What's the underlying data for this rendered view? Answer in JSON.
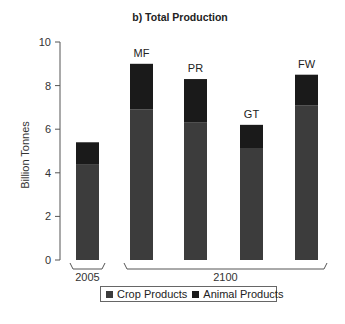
{
  "chart_data": {
    "type": "bar",
    "stacked": true,
    "title": "b) Total Production",
    "xlabel": "",
    "ylabel": "Billion Tonnes",
    "ylim": [
      0,
      10
    ],
    "yticks": [
      0,
      2,
      4,
      6,
      8,
      10
    ],
    "grid": false,
    "categories": [
      "2005",
      "MF",
      "PR",
      "GT",
      "FW"
    ],
    "bar_labels": [
      "",
      "MF",
      "PR",
      "GT",
      "FW"
    ],
    "groups": [
      {
        "label": "2005",
        "categories": [
          "2005"
        ]
      },
      {
        "label": "2100",
        "categories": [
          "MF",
          "PR",
          "GT",
          "FW"
        ]
      }
    ],
    "series": [
      {
        "name": "Crop Products",
        "color": "#3c3c3c",
        "values": [
          4.4,
          6.9,
          6.3,
          5.1,
          7.1
        ]
      },
      {
        "name": "Animal Products",
        "color": "#1a1a1a",
        "values": [
          1.0,
          2.1,
          2.0,
          1.1,
          1.4
        ]
      }
    ],
    "legend_position": "bottom"
  },
  "legend": {
    "items": [
      {
        "label": "Crop Products",
        "color": "#3c3c3c"
      },
      {
        "label": "Animal Products",
        "color": "#1a1a1a"
      }
    ]
  }
}
